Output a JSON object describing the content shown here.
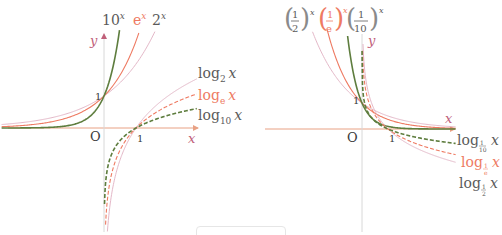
{
  "colors": {
    "axis": "#e8a184",
    "axis_label": "#c0607a",
    "green": "#5e7d3e",
    "orange": "#ee7a62",
    "pink": "#e4b8c8",
    "text": "#3a3a3a",
    "y_axis_line": "#d8d8d8"
  },
  "left_panel": {
    "origin_label": "O",
    "x_label": "x",
    "y_label": "y",
    "tick_x": "1",
    "tick_y": "1",
    "labels": {
      "exp10": "10",
      "exp10_sup": "x",
      "expe": "e",
      "expe_sup": "x",
      "exp2": "2",
      "exp2_sup": "x",
      "log2": "log",
      "log2_sub": "2",
      "loge": "log",
      "loge_sub": "e",
      "log10": "log",
      "log10_sub": "10",
      "var": "x"
    }
  },
  "right_panel": {
    "origin_label": "O",
    "x_label": "x",
    "y_label": "y",
    "tick_x": "1",
    "tick_y": "1",
    "labels": {
      "half": "(1/2)",
      "half_sup": "x",
      "inv_e": "(1/e)",
      "inv_e_sup": "x",
      "tenth": "(1/10)",
      "tenth_sup": "x",
      "log_tenth": "log",
      "log_tenth_sub": "1/10",
      "log_inv_e": "log",
      "log_inv_e_sub": "1/e",
      "log_half": "log",
      "log_half_sub": "1/2",
      "var": "x"
    }
  },
  "chart_data": [
    {
      "type": "line",
      "title": "Exponential and logarithmic functions (base > 1)",
      "xlabel": "x",
      "ylabel": "y",
      "series": [
        {
          "name": "10^x",
          "style": "solid",
          "color": "green"
        },
        {
          "name": "e^x",
          "style": "solid",
          "color": "orange"
        },
        {
          "name": "2^x",
          "style": "solid",
          "color": "pink"
        },
        {
          "name": "log_2 x",
          "style": "solid",
          "color": "pink"
        },
        {
          "name": "log_e x",
          "style": "dashed",
          "color": "orange"
        },
        {
          "name": "log_10 x",
          "style": "dashed",
          "color": "green"
        }
      ],
      "annotations": [
        "O",
        "1 (x-axis)",
        "1 (y-axis)"
      ],
      "grid": false
    },
    {
      "type": "line",
      "title": "Exponential and logarithmic functions (0 < base < 1)",
      "xlabel": "x",
      "ylabel": "y",
      "series": [
        {
          "name": "(1/2)^x",
          "style": "solid",
          "color": "pink"
        },
        {
          "name": "(1/e)^x",
          "style": "solid",
          "color": "orange"
        },
        {
          "name": "(1/10)^x",
          "style": "solid",
          "color": "green"
        },
        {
          "name": "log_{1/10} x",
          "style": "dashed",
          "color": "green"
        },
        {
          "name": "log_{1/e} x",
          "style": "dashed",
          "color": "orange"
        },
        {
          "name": "log_{1/2} x",
          "style": "solid",
          "color": "pink"
        }
      ],
      "annotations": [
        "O",
        "1 (x-axis)",
        "1 (y-axis)"
      ],
      "grid": false
    }
  ]
}
